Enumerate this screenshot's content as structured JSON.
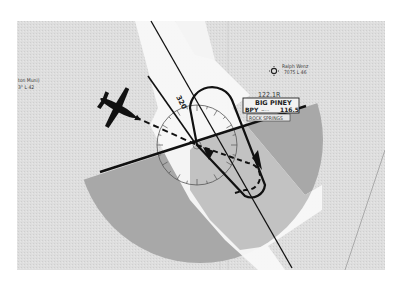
{
  "figure": {
    "colors": {
      "page_bg": "#ffffff",
      "map_bg": "#dcdcdc",
      "corridor": "#f7f7f7",
      "sector_dark": "#a9a9a9",
      "sector_light": "#bdbdbd",
      "ink": "#111111"
    }
  },
  "radial": {
    "label": "320"
  },
  "vor": {
    "frequency": "122.1R",
    "name": "BIG PINEY",
    "identifier": "BPY",
    "morse": "−···",
    "vor_frequency": "116.5",
    "fss": "ROCK SPRINGS"
  },
  "airports": [
    {
      "name": "Ralph Wenz",
      "info": "7075 L 46"
    },
    {
      "name": "ton Muni)",
      "info": "3° L 42"
    }
  ],
  "aircraft": {
    "icon": "airplane-icon"
  },
  "holding_pattern": {
    "type": "racetrack",
    "entry": "dashed"
  }
}
